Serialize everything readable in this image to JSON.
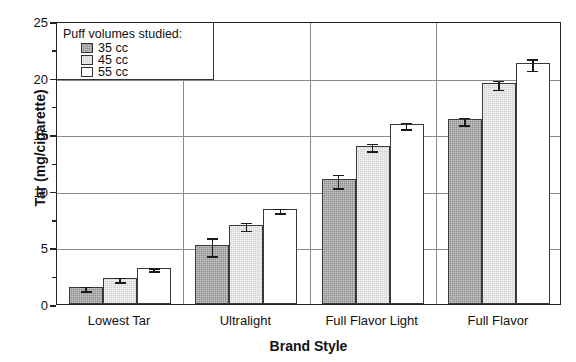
{
  "chart_data": {
    "type": "bar",
    "title": "",
    "xlabel": "Brand Style",
    "ylabel": "Tar (mg/cigarette)",
    "categories": [
      "Lowest Tar",
      "Ultralight",
      "Full Flavor Light",
      "Full Flavor"
    ],
    "ylim": [
      0,
      25
    ],
    "yticks": [
      0,
      5,
      10,
      15,
      20,
      25
    ],
    "ytick_labels": [
      "0",
      "5",
      "10",
      "15",
      "20",
      "25"
    ],
    "grid": true,
    "legend_position": "upper-left",
    "legend_title": "Puff volumes studied:",
    "series": [
      {
        "name": "35 cc",
        "color": "#8e8e8e",
        "values": [
          1.5,
          5.2,
          11.0,
          16.3
        ],
        "errors": [
          0.2,
          0.8,
          0.6,
          0.35
        ]
      },
      {
        "name": "45 cc",
        "color": "#d2d2d2",
        "values": [
          2.3,
          7.0,
          14.0,
          19.5
        ],
        "errors": [
          0.2,
          0.35,
          0.35,
          0.4
        ]
      },
      {
        "name": "55 cc",
        "color": "#ffffff",
        "values": [
          3.2,
          8.4,
          15.9,
          21.3
        ],
        "errors": [
          0.12,
          0.2,
          0.3,
          0.5
        ]
      }
    ]
  },
  "axis": {
    "y_title": "Tar (mg/cigarette)",
    "x_title": "Brand Style"
  },
  "legend": {
    "title": "Puff volumes studied:",
    "items": [
      {
        "label": "35 cc",
        "color": "#8e8e8e"
      },
      {
        "label": "45 cc",
        "color": "#d2d2d2"
      },
      {
        "label": "55 cc",
        "color": "#ffffff"
      }
    ]
  }
}
